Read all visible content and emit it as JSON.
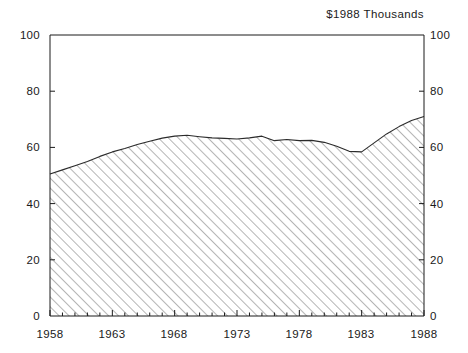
{
  "chart_data": {
    "type": "area",
    "title": "$1988 Thousands",
    "xlabel": "",
    "ylabel": "",
    "xlim": [
      1958,
      1988
    ],
    "ylim": [
      0,
      100
    ],
    "grid": false,
    "legend": null,
    "x_ticks_major": [
      1958,
      1963,
      1968,
      1973,
      1978,
      1983,
      1988
    ],
    "x_ticks_minor_step": 1,
    "y_ticks": [
      0,
      20,
      40,
      60,
      80,
      100
    ],
    "y_axis_right_mirrored": true,
    "fill": "diagonal-hatch",
    "x": [
      1958,
      1959,
      1960,
      1961,
      1962,
      1963,
      1964,
      1965,
      1966,
      1967,
      1968,
      1969,
      1970,
      1971,
      1972,
      1973,
      1974,
      1975,
      1976,
      1977,
      1978,
      1979,
      1980,
      1981,
      1982,
      1983,
      1984,
      1985,
      1986,
      1987,
      1988
    ],
    "values": [
      50.5,
      52.0,
      53.5,
      55.0,
      56.8,
      58.4,
      59.6,
      61.0,
      62.2,
      63.3,
      64.0,
      64.3,
      63.8,
      63.4,
      63.2,
      63.0,
      63.4,
      64.0,
      62.4,
      62.8,
      62.4,
      62.5,
      61.8,
      60.4,
      58.6,
      58.4,
      61.6,
      64.8,
      67.4,
      69.6,
      71.0
    ],
    "series": [
      {
        "name": "$1988 Thousands",
        "values": [
          50.5,
          52.0,
          53.5,
          55.0,
          56.8,
          58.4,
          59.6,
          61.0,
          62.2,
          63.3,
          64.0,
          64.3,
          63.8,
          63.4,
          63.2,
          63.0,
          63.4,
          64.0,
          62.4,
          62.8,
          62.4,
          62.5,
          61.8,
          60.4,
          58.6,
          58.4,
          61.6,
          64.8,
          67.4,
          69.6,
          71.0
        ]
      }
    ]
  },
  "axes": {
    "y_left_labels": [
      "100",
      "80",
      "60",
      "40",
      "20",
      "0"
    ],
    "y_right_labels": [
      "100",
      "80",
      "60",
      "40",
      "20",
      "0"
    ],
    "x_labels": [
      "1958",
      "1963",
      "1968",
      "1973",
      "1978",
      "1983",
      "1988"
    ]
  },
  "colors": {
    "axis": "#1a1a1a",
    "line": "#2b2b2b",
    "hatch": "#5a5a5a",
    "background": "#ffffff"
  }
}
